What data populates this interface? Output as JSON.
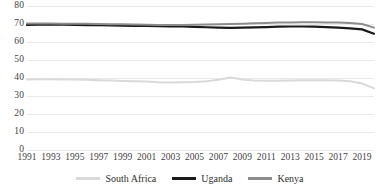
{
  "chart_data": {
    "type": "line",
    "title": "",
    "subtitle": "",
    "xlabel": "",
    "ylabel": "",
    "xlim": [
      1991,
      2020
    ],
    "ylim": [
      0,
      80
    ],
    "ytick_step": 10,
    "yticks": [
      0,
      10,
      20,
      30,
      40,
      50,
      60,
      70,
      80
    ],
    "ytick_labels": [
      "0",
      "10",
      "20",
      "30",
      "40",
      "50",
      "60",
      "70",
      "80"
    ],
    "x": [
      1991,
      1992,
      1993,
      1994,
      1995,
      1996,
      1997,
      1998,
      1999,
      2000,
      2001,
      2002,
      2003,
      2004,
      2005,
      2006,
      2007,
      2008,
      2009,
      2010,
      2011,
      2012,
      2013,
      2014,
      2015,
      2016,
      2017,
      2018,
      2019,
      2020
    ],
    "xticks": [
      1991,
      1993,
      1995,
      1997,
      1999,
      2001,
      2003,
      2005,
      2007,
      2009,
      2011,
      2013,
      2015,
      2017,
      2019
    ],
    "xtick_labels": [
      "1991",
      "1993",
      "1995",
      "1997",
      "1999",
      "2001",
      "2003",
      "2005",
      "2007",
      "2009",
      "2011",
      "2013",
      "2015",
      "2017",
      "2019"
    ],
    "grid": true,
    "grid_axis": "y",
    "legend_position": "bottom",
    "series": [
      {
        "name": "South Africa",
        "color": "#d9d9d9",
        "width": 2.0,
        "values": [
          39.2,
          39.3,
          39.3,
          39.2,
          39.1,
          39.0,
          38.8,
          38.6,
          38.4,
          38.2,
          38.0,
          37.6,
          37.5,
          37.6,
          37.8,
          38.2,
          39.0,
          40.3,
          39.2,
          38.6,
          38.5,
          38.5,
          38.6,
          38.8,
          38.8,
          38.7,
          38.6,
          38.2,
          37.0,
          34.2
        ]
      },
      {
        "name": "Uganda",
        "color": "#1a1a1a",
        "width": 2.2,
        "values": [
          69.5,
          69.6,
          69.6,
          69.6,
          69.5,
          69.4,
          69.3,
          69.2,
          69.1,
          69.0,
          68.9,
          68.8,
          68.7,
          68.6,
          68.4,
          68.2,
          68.0,
          67.9,
          68.0,
          68.1,
          68.3,
          68.5,
          68.6,
          68.6,
          68.5,
          68.3,
          68.0,
          67.6,
          67.0,
          64.6
        ]
      },
      {
        "name": "Kenya",
        "color": "#8c8c8c",
        "width": 2.0,
        "values": [
          70.3,
          70.3,
          70.3,
          70.2,
          70.2,
          70.1,
          70.0,
          69.9,
          69.8,
          69.7,
          69.6,
          69.5,
          69.5,
          69.5,
          69.6,
          69.7,
          69.8,
          70.0,
          70.2,
          70.4,
          70.6,
          70.8,
          70.9,
          71.0,
          71.0,
          70.9,
          70.8,
          70.5,
          70.0,
          68.0
        ]
      }
    ]
  },
  "legend": {
    "items": [
      {
        "label": "South Africa",
        "color": "#d9d9d9"
      },
      {
        "label": "Uganda",
        "color": "#1a1a1a"
      },
      {
        "label": "Kenya",
        "color": "#8c8c8c"
      }
    ]
  }
}
